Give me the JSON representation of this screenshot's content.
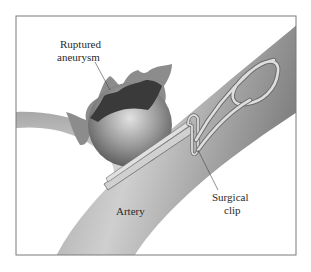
{
  "figure": {
    "labels": {
      "aneurysm_line1": "Ruptured",
      "aneurysm_line2": "aneurysm",
      "clip_line1": "Surgical",
      "clip_line2": "clip",
      "artery": "Artery"
    },
    "colors": {
      "frame": "#7a7a7a",
      "artery_light": "#e6e6e6",
      "artery_dark": "#8a8a8a",
      "sphere_light": "#d8d8d8",
      "sphere_dark": "#5e5e5e",
      "rupture_outer": "#8c8c8c",
      "rupture_inner": "#3a3a3a",
      "clip": "#d0d0d0"
    }
  }
}
